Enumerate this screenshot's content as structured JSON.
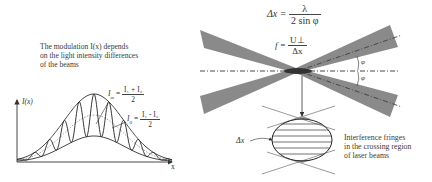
{
  "left_panel": {
    "caption_lines": [
      "The modulation I(x) depends",
      "on the light intensity differences",
      "of the beams"
    ],
    "y_axis_label": "I(x)",
    "x_axis_label": "x",
    "Im_label": "I",
    "Im_sub": "m",
    "Im_num": "I₁ + I₂",
    "Im_den": "2",
    "I0_label": "I",
    "I0_sub": "0",
    "I0_num": "I₁ - I₂",
    "I0_den": "2"
  },
  "right_panel": {
    "dx_lhs": "Δx =",
    "dx_num": "λ",
    "dx_den": "2 sin φ",
    "f_lhs": "f =",
    "f_num": "U⊥",
    "f_den": "Δx",
    "angle_label_top": "φ",
    "angle_label_bottom": "φ",
    "fringe_spacing_label": "Δx",
    "caption_lines": [
      "Interference fringes",
      "in the crossing region",
      "of laser beams"
    ]
  },
  "colors": {
    "beam": "#8a8a8a",
    "line": "#333333",
    "text": "#3a3a3a"
  }
}
